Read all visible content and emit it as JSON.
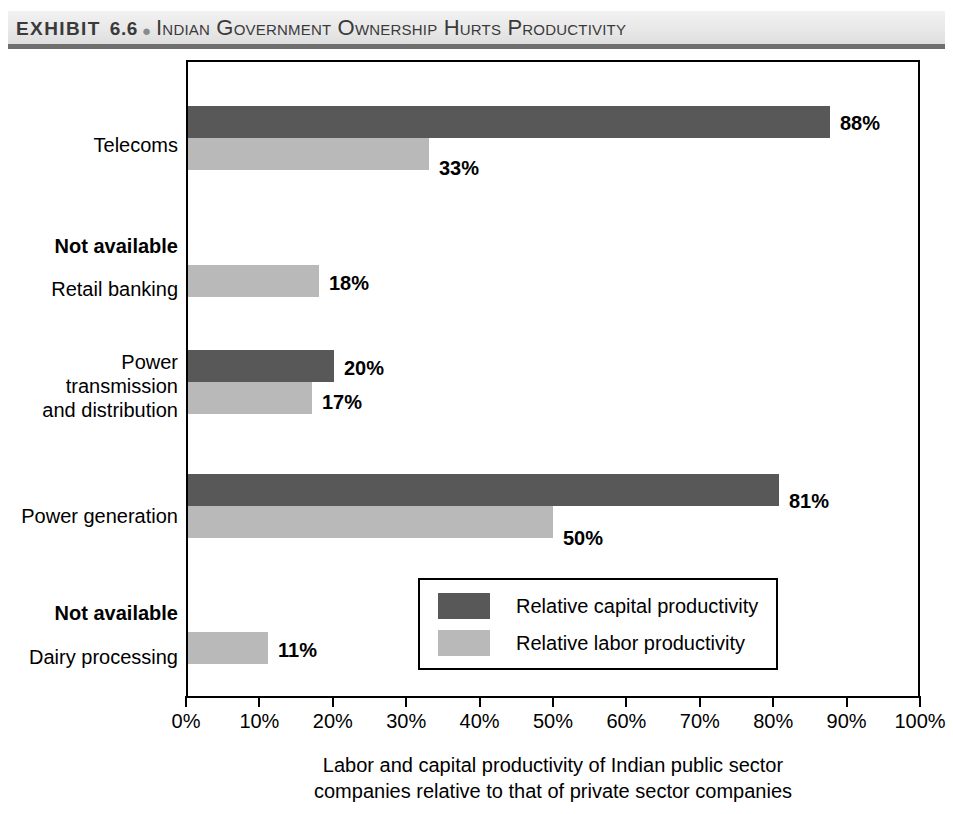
{
  "header": {
    "exhibit_label": "EXHIBIT",
    "exhibit_number": "6.6",
    "bullet": "●",
    "title": "Indian Government Ownership Hurts Productivity"
  },
  "legend": {
    "items": [
      {
        "label": "Relative capital productivity",
        "color": "#585858",
        "key": "capital"
      },
      {
        "label": "Relative labor productivity",
        "color": "#b9b9b9",
        "key": "labor"
      }
    ]
  },
  "caption": {
    "line1": "Labor and capital productivity of Indian public sector",
    "line2": "companies relative to that of private sector companies"
  },
  "axis": {
    "tick_labels": [
      "0%",
      "10%",
      "20%",
      "30%",
      "40%",
      "50%",
      "60%",
      "70%",
      "80%",
      "90%",
      "100%"
    ]
  },
  "categories": [
    {
      "name": "Telecoms",
      "not_available": null
    },
    {
      "name": "Retail banking",
      "not_available": "Not available"
    },
    {
      "name": "Power\ntransmission\nand distribution",
      "not_available": null
    },
    {
      "name": "Power generation",
      "not_available": null
    },
    {
      "name": "Dairy processing",
      "not_available": "Not available"
    }
  ],
  "bar_labels": {
    "telecoms_capital": "88%",
    "telecoms_labor": "33%",
    "retail_labor": "18%",
    "power_trans_capital": "20%",
    "power_trans_labor": "17%",
    "power_gen_capital": "81%",
    "power_gen_labor": "50%",
    "dairy_labor": "11%"
  },
  "chart_data": {
    "type": "bar",
    "orientation": "horizontal",
    "title": "Indian Government Ownership Hurts Productivity",
    "xlabel": "Labor and capital productivity of Indian public sector companies relative to that of private sector companies",
    "ylabel": "",
    "xlim": [
      0,
      100
    ],
    "xticks": [
      0,
      10,
      20,
      30,
      40,
      50,
      60,
      70,
      80,
      90,
      100
    ],
    "xtick_labels": [
      "0%",
      "10%",
      "20%",
      "30%",
      "40%",
      "50%",
      "60%",
      "70%",
      "80%",
      "90%",
      "100%"
    ],
    "grid": false,
    "legend_position": "inside-lower-center",
    "categories": [
      "Telecoms",
      "Retail banking",
      "Power transmission and distribution",
      "Power generation",
      "Dairy processing"
    ],
    "series": [
      {
        "name": "Relative capital productivity",
        "color": "#585858",
        "values": [
          88,
          null,
          20,
          81,
          null
        ],
        "missing_note": "Not available"
      },
      {
        "name": "Relative labor productivity",
        "color": "#b9b9b9",
        "values": [
          33,
          18,
          17,
          50,
          11
        ]
      }
    ]
  }
}
